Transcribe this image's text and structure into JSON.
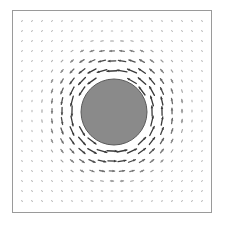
{
  "figure": {
    "type": "vector_field",
    "frame": {
      "x": 12,
      "y": 10,
      "width": 200,
      "height": 203,
      "stroke": "#9a9a9a"
    },
    "obstacle": {
      "cx": 114,
      "cy": 112,
      "r": 33,
      "fill": "#8a8a8a",
      "stroke": "#5a5a5a"
    },
    "grid": {
      "x0": 22,
      "y0": 21,
      "dx": 10,
      "dy": 10,
      "nx": 19,
      "ny": 19
    },
    "vortex": {
      "direction": "counter-clockwise",
      "strength": 11,
      "decay_radius": 60
    },
    "colors": {
      "arrow_strong": "#3a3a3a",
      "arrow_weak": "#d0d0d0",
      "background": "#ffffff"
    }
  }
}
